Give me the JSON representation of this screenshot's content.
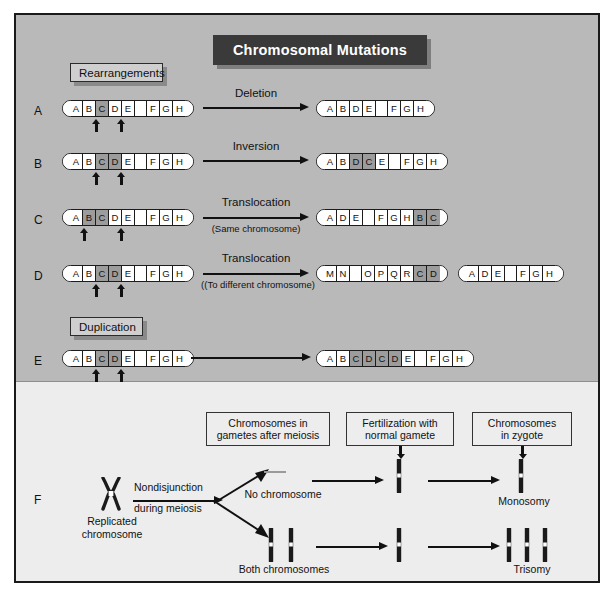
{
  "figure": {
    "title": "Chromosomal Mutations",
    "background_color": "#b9b9b9",
    "lower_background_color": "#ededed",
    "border_color": "#1a1a1a",
    "shaded_segment_color": "#9c9c9c"
  },
  "sections": {
    "rearrangements": "Rearrangements",
    "duplication": "Duplication",
    "numerical_changes": "Numerical changes"
  },
  "rows": [
    {
      "letter": "A",
      "operation": "Deletion",
      "operation_sub": "",
      "source": {
        "segments": [
          "A",
          "B",
          "C",
          "D",
          "E",
          "",
          "F",
          "G",
          "H"
        ],
        "shaded": [
          2
        ]
      },
      "results": [
        {
          "segments": [
            "A",
            "B",
            "D",
            "E",
            "",
            "F",
            "G",
            "H"
          ],
          "shaded": []
        }
      ],
      "markers": [
        2,
        3
      ]
    },
    {
      "letter": "B",
      "operation": "Inversion",
      "operation_sub": "",
      "source": {
        "segments": [
          "A",
          "B",
          "C",
          "D",
          "E",
          "",
          "F",
          "G",
          "H"
        ],
        "shaded": [
          2,
          3
        ]
      },
      "results": [
        {
          "segments": [
            "A",
            "B",
            "D",
            "C",
            "E",
            "",
            "F",
            "G",
            "H"
          ],
          "shaded": [
            2,
            3
          ]
        }
      ],
      "markers": [
        2,
        4
      ]
    },
    {
      "letter": "C",
      "operation": "Translocation",
      "operation_sub": "(Same chromosome)",
      "source": {
        "segments": [
          "A",
          "B",
          "C",
          "D",
          "E",
          "",
          "F",
          "G",
          "H"
        ],
        "shaded": [
          1,
          2
        ]
      },
      "results": [
        {
          "segments": [
            "A",
            "D",
            "E",
            "",
            "F",
            "G",
            "H",
            "B",
            "C"
          ],
          "shaded": [
            7,
            8
          ]
        }
      ],
      "markers": [
        1,
        3
      ]
    },
    {
      "letter": "D",
      "operation": "Translocation",
      "operation_sub": "((To different chromosome)",
      "source": {
        "segments": [
          "A",
          "B",
          "C",
          "D",
          "E",
          "",
          "F",
          "G",
          "H"
        ],
        "shaded": [
          2,
          3
        ]
      },
      "results": [
        {
          "segments": [
            "M",
            "N",
            "",
            "O",
            "P",
            "Q",
            "R",
            "C",
            "D"
          ],
          "shaded": [
            7,
            8
          ]
        },
        {
          "segments": [
            "A",
            "D",
            "E",
            "",
            "F",
            "G",
            "H"
          ],
          "shaded": []
        }
      ],
      "markers": [
        2,
        4
      ]
    },
    {
      "letter": "E",
      "operation": "",
      "operation_sub": "",
      "source": {
        "segments": [
          "A",
          "B",
          "C",
          "D",
          "E",
          "",
          "F",
          "G",
          "H"
        ],
        "shaded": [
          2,
          3
        ]
      },
      "results": [
        {
          "segments": [
            "A",
            "B",
            "C",
            "D",
            "C",
            "D",
            "E",
            "",
            "F",
            "G",
            "H"
          ],
          "shaded": [
            2,
            3,
            4,
            5
          ]
        }
      ],
      "markers": [
        2,
        4
      ]
    }
  ],
  "numerical": {
    "row_letter": "F",
    "headers": [
      {
        "line1": "Chromosomes in",
        "line2": "gametes after meiosis"
      },
      {
        "line1": "Fertilization with",
        "line2": "normal gamete"
      },
      {
        "line1": "Chromosomes",
        "line2": "in zygote"
      }
    ],
    "source_caption": {
      "line1": "Replicated",
      "line2": "chromosome"
    },
    "process_label": {
      "line1": "Nondisjunction",
      "line2": "during meiosis"
    },
    "branches": [
      {
        "gamete_label": "No chromosome",
        "gamete_chromosome_count": 0,
        "fertilized_chromosome_count": 1,
        "zygote_chromosome_count": 1,
        "outcome_label": "Monosomy"
      },
      {
        "gamete_label": "Both chromosomes",
        "gamete_chromosome_count": 2,
        "fertilized_chromosome_count": 1,
        "zygote_chromosome_count": 3,
        "outcome_label": "Trisomy"
      }
    ]
  }
}
